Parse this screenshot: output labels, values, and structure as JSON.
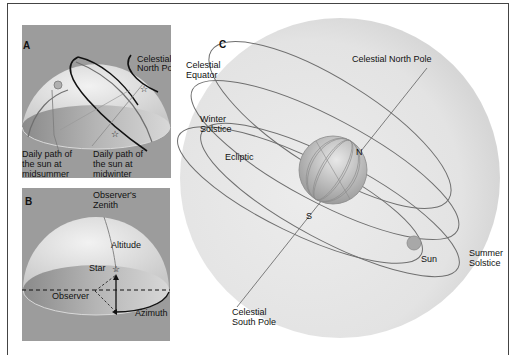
{
  "panels": {
    "a": {
      "letter": "A",
      "celestial_north_pole": [
        "Celestial",
        "North Pole"
      ],
      "midsummer_path": [
        "Daily path of",
        "the sun at",
        "midsummer"
      ],
      "midwinter_path": [
        "Daily path of",
        "the sun at",
        "midwinter"
      ]
    },
    "b": {
      "letter": "B",
      "zenith": [
        "Observer's",
        "Zenith"
      ],
      "altitude": "Altitude",
      "star": "Star",
      "observer": "Observer",
      "azimuth": "Azimuth"
    },
    "c": {
      "letter": "C",
      "celestial_equator": [
        "Celestial",
        "Equator"
      ],
      "celestial_north_pole": "Celestial North Pole",
      "winter_solstice": [
        "Winter",
        "Solstice"
      ],
      "ecliptic": "Ecliptic",
      "north": "N",
      "south": "S",
      "sun": "Sun",
      "summer_solstice": [
        "Summer",
        "Solstice"
      ],
      "celestial_south_pole": [
        "Celestial",
        "South Pole"
      ]
    }
  },
  "colors": {
    "panel_bg": "#9a9a9a",
    "sphere_light": "#e6e6e6",
    "line_dark": "#111111",
    "line_grey": "#6f6f6f",
    "sun": "#a8a8a8"
  }
}
